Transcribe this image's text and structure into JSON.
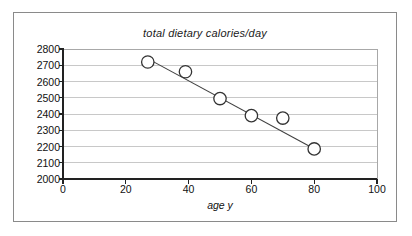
{
  "chart_data": {
    "type": "scatter",
    "title": "total dietary calories/day",
    "xlabel": "age y",
    "ylabel": "",
    "xlim": [
      0,
      100
    ],
    "ylim": [
      2000,
      2800
    ],
    "xticks": [
      0,
      20,
      40,
      60,
      80,
      100
    ],
    "yticks": [
      2000,
      2100,
      2200,
      2300,
      2400,
      2500,
      2600,
      2700,
      2800
    ],
    "grid": "horizontal",
    "legend": "none",
    "marker": "open-circle",
    "series": [
      {
        "name": "total dietary calories/day",
        "points": [
          {
            "x": 27,
            "y": 2720
          },
          {
            "x": 39,
            "y": 2660
          },
          {
            "x": 50,
            "y": 2495
          },
          {
            "x": 60,
            "y": 2390
          },
          {
            "x": 70,
            "y": 2375
          },
          {
            "x": 80,
            "y": 2185
          }
        ]
      }
    ],
    "trendline": {
      "type": "linear",
      "x_start": 28,
      "y_start": 2730,
      "x_end": 81,
      "y_end": 2175,
      "color": "#404040"
    },
    "colors": {
      "marker_stroke": "#333333",
      "marker_fill": "#ffffff",
      "gridline": "#c8c8c8",
      "axis": "#222222",
      "frame": "#8a8a8a",
      "text": "#111111"
    }
  },
  "labels": {
    "y": [
      "2800",
      "2700",
      "2600",
      "2500",
      "2400",
      "2300",
      "2200",
      "2100",
      "2000"
    ],
    "x": [
      "0",
      "20",
      "40",
      "60",
      "80",
      "100"
    ]
  }
}
